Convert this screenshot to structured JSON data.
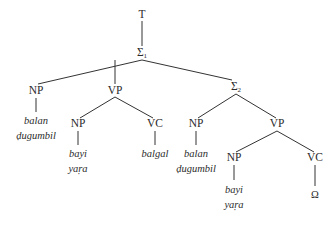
{
  "diagram": {
    "type": "syntax-tree",
    "nodes": {
      "root": {
        "label": "T"
      },
      "s1": {
        "label": "Σ",
        "sub": "1"
      },
      "np1": {
        "label": "NP"
      },
      "vp1": {
        "label": "VP"
      },
      "s2": {
        "label": "Σ",
        "sub": "2"
      },
      "np2": {
        "label": "NP"
      },
      "vc1": {
        "label": "VC"
      },
      "np3": {
        "label": "NP"
      },
      "vp2": {
        "label": "VP"
      },
      "np4": {
        "label": "NP"
      },
      "vc2": {
        "label": "VC"
      }
    },
    "leaves": {
      "np1": {
        "line1": "balan",
        "line2": "ḍugumbil"
      },
      "np2": {
        "line1": "bayi",
        "line2": "yaṛa"
      },
      "vc1": {
        "line1": "balgal"
      },
      "np3": {
        "line1": "balan",
        "line2": "ḍugumbil"
      },
      "np4": {
        "line1": "bayi",
        "line2": "yaṛa"
      },
      "vc2": {
        "line1": "Ω"
      }
    },
    "edges": [
      [
        "T",
        "Σ1"
      ],
      [
        "Σ1",
        "NP"
      ],
      [
        "Σ1",
        "VP"
      ],
      [
        "Σ1",
        "Σ2"
      ],
      [
        "VP",
        "NP"
      ],
      [
        "VP",
        "VC"
      ],
      [
        "Σ2",
        "NP"
      ],
      [
        "Σ2",
        "VP"
      ],
      [
        "VP",
        "NP"
      ],
      [
        "VP",
        "VC"
      ]
    ]
  }
}
